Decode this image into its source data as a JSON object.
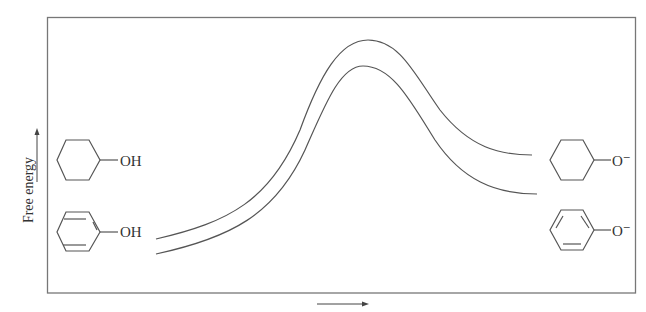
{
  "diagram": {
    "type": "free-energy-profile",
    "y_axis_label": "Free energy",
    "x_axis_arrow": true,
    "left_species": [
      {
        "name": "cyclohexanol",
        "substituent": "OH",
        "ring": "cyclohexane"
      },
      {
        "name": "phenol",
        "substituent": "OH",
        "ring": "benzene"
      }
    ],
    "right_species": [
      {
        "name": "cyclohexoxide",
        "substituent": "O⁻",
        "ring": "cyclohexane"
      },
      {
        "name": "phenoxide",
        "substituent": "O⁻",
        "ring": "benzene"
      }
    ],
    "curves": [
      {
        "name": "cyclohexanol-ionization-curve",
        "start_y": 239,
        "peak_y": 40,
        "end_y": 155
      },
      {
        "name": "phenol-ionization-curve",
        "start_y": 254,
        "peak_y": 66,
        "end_y": 194
      }
    ],
    "colors": {
      "line": "#555555",
      "text": "#333333",
      "frame": "#777777"
    }
  }
}
